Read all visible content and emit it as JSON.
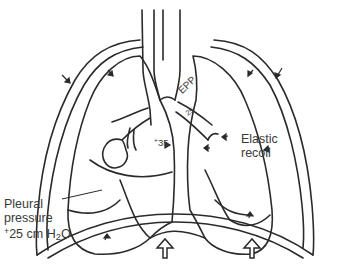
{
  "diagram": {
    "labels": {
      "epp": "EPP",
      "airway_pressure": "25",
      "alveolar_pressure_sign": "+",
      "alveolar_pressure": "35",
      "elastic_recoil_line1": "Elastic",
      "elastic_recoil_line2": "recoil",
      "pleural_line1": "Pleural",
      "pleural_line2": "pressure",
      "pleural_sign": "+",
      "pleural_value": "25 cm H",
      "pleural_sub": "2",
      "pleural_unit_end": "O"
    },
    "icons": {
      "inward_arrows": "small arrows indicating inward compression on chest wall and lungs",
      "diaphragm_arrows": "two hollow upward arrows pushing diaphragm"
    },
    "colors": {
      "line": "#2a2a2a",
      "text": "#3a3a3a",
      "background": "#ffffff"
    }
  }
}
